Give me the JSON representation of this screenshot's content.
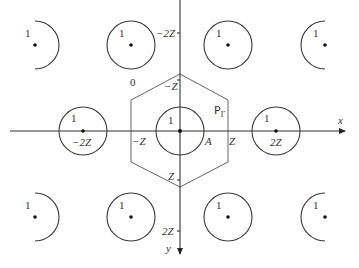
{
  "diagram": {
    "axes": {
      "x_label": "x",
      "y_label": "y",
      "x_ticks": [
        "-2Z",
        "-Z",
        "Z",
        "2Z"
      ],
      "y_ticks": [
        "-2Z",
        "-Z",
        "Z",
        "2Z"
      ]
    },
    "labels": {
      "x_axis": "x",
      "y_axis": "y",
      "neg_2z_y": "−2Z",
      "neg_z_y": "−Z",
      "pos_z_y": "Z",
      "pos_2z_y": "2Z",
      "neg_2z_x": "−2Z",
      "neg_z_x": "−Z",
      "pos_z_x": "Z",
      "pos_2z_x": "2Z",
      "point_a": "A",
      "region_p": "P",
      "region_p_sub": "Γ",
      "zero_label": "0",
      "circle_label": "1"
    },
    "circles": [
      {
        "id": "top-left-partial",
        "label": "1",
        "partial": true
      },
      {
        "id": "top-mid-left",
        "label": "1"
      },
      {
        "id": "top-mid-right",
        "label": "1"
      },
      {
        "id": "top-right-partial",
        "label": "1",
        "partial": true
      },
      {
        "id": "mid-left",
        "label": "1",
        "center_label": "−2Z"
      },
      {
        "id": "center",
        "label": "1"
      },
      {
        "id": "mid-right",
        "label": "1",
        "center_label": "2Z"
      },
      {
        "id": "bottom-left-partial",
        "label": "1",
        "partial": true
      },
      {
        "id": "bottom-mid-left",
        "label": "1"
      },
      {
        "id": "bottom-mid-right",
        "label": "1"
      },
      {
        "id": "bottom-right-partial",
        "label": "1",
        "partial": true
      }
    ],
    "hexagon": {
      "label": "PΓ",
      "description": "hexagonal region around origin"
    }
  }
}
